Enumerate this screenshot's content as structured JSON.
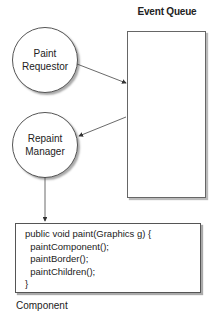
{
  "diagram": {
    "event_queue": {
      "title": "Event Queue"
    },
    "nodes": [
      {
        "id": "paint-requestor",
        "lines": [
          "Paint",
          "Requestor"
        ]
      },
      {
        "id": "repaint-manager",
        "lines": [
          "Repaint",
          "Manager"
        ]
      }
    ],
    "code_box": {
      "lines": [
        "public void paint(Graphics g) {",
        "  paintComponent();",
        "  paintBorder();",
        "  paintChildren();",
        "}"
      ],
      "label": "Component"
    },
    "edges": [
      {
        "from": "paint-requestor",
        "to": "event-queue"
      },
      {
        "from": "event-queue",
        "to": "repaint-manager"
      },
      {
        "from": "repaint-manager",
        "to": "component"
      }
    ]
  }
}
